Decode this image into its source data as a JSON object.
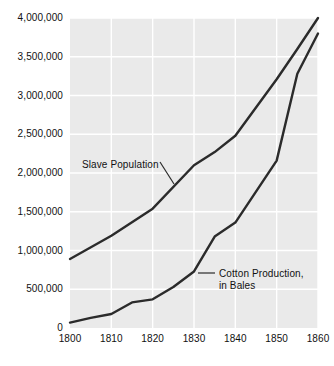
{
  "chart_data": {
    "type": "line",
    "title": "",
    "subtitle": "",
    "xlabel": "",
    "ylabel": "",
    "xlim": [
      1800,
      1860
    ],
    "ylim": [
      0,
      4000000
    ],
    "grid": true,
    "legend_position": "inline-annotations",
    "x_tick_labels": [
      "1800",
      "1810",
      "1820",
      "1830",
      "1840",
      "1850",
      "1860"
    ],
    "x_ticks": [
      1800,
      1810,
      1820,
      1830,
      1840,
      1850,
      1860
    ],
    "y_tick_labels": [
      "0",
      "500,000",
      "1,000,000",
      "1,500,000",
      "2,000,000",
      "2,500,000",
      "3,000,000",
      "3,500,000",
      "4,000,000"
    ],
    "y_ticks": [
      0,
      500000,
      1000000,
      1500000,
      2000000,
      2500000,
      3000000,
      3500000,
      4000000
    ],
    "plot_bg_color": "#eaeaea",
    "grid_color": "#ffffff",
    "line_color": "#2b2b2b",
    "series": [
      {
        "name": "Slave Population",
        "label_lines": [
          "Slave Population"
        ],
        "x": [
          1800,
          1810,
          1820,
          1830,
          1835,
          1840,
          1850,
          1855,
          1860
        ],
        "values": [
          890000,
          1190000,
          1540000,
          2100000,
          2270000,
          2480000,
          3210000,
          3600000,
          4000000
        ]
      },
      {
        "name": "Cotton Production, in Bales",
        "label_lines": [
          "Cotton Production,",
          "in Bales"
        ],
        "x": [
          1800,
          1805,
          1810,
          1815,
          1820,
          1825,
          1830,
          1835,
          1840,
          1845,
          1850,
          1855,
          1860
        ],
        "values": [
          70000,
          130000,
          180000,
          330000,
          370000,
          530000,
          730000,
          1180000,
          1360000,
          1760000,
          2160000,
          3280000,
          3800000
        ]
      }
    ],
    "annotations": [
      {
        "name": "slave-population-annotation",
        "text_lines": [
          "Slave Population"
        ],
        "text_x": 82,
        "text_y": 159,
        "leader": {
          "x1": 160,
          "y1": 162,
          "x2": 174,
          "y2": 184
        }
      },
      {
        "name": "cotton-production-annotation",
        "text_lines": [
          "Cotton Production,",
          "in Bales"
        ],
        "text_x": 219,
        "text_y": 268,
        "leader": {
          "x1": 198,
          "y1": 273,
          "x2": 215,
          "y2": 273
        }
      }
    ]
  },
  "geometry": {
    "plot_left": 70,
    "plot_right": 318,
    "plot_top": 18,
    "plot_bottom": 328
  }
}
